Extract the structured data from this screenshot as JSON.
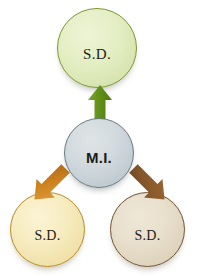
{
  "diagram": {
    "nodes": [
      {
        "id": "top",
        "label": "S.D.",
        "fill": "#e4eec4",
        "stroke": "#7e9430",
        "position": "top"
      },
      {
        "id": "center",
        "label": "M.I.",
        "fill": "#d2dade",
        "stroke": "#69797f",
        "position": "center"
      },
      {
        "id": "bottom-left",
        "label": "S.D.",
        "fill": "#f7ecc0",
        "stroke": "#b88a27",
        "position": "bottom-left"
      },
      {
        "id": "bottom-right",
        "label": "S.D.",
        "fill": "#e8dfcc",
        "stroke": "#6f5232",
        "position": "bottom-right"
      }
    ],
    "arrows": [
      {
        "id": "arrow-up",
        "from": "center",
        "to": "top",
        "direction": "up",
        "color": "#5f8c1e"
      },
      {
        "id": "arrow-down-left",
        "from": "center",
        "to": "bottom-left",
        "direction": "down-left",
        "color": "#cf8420"
      },
      {
        "id": "arrow-down-right",
        "from": "center",
        "to": "bottom-right",
        "direction": "down-right",
        "color": "#8b5a2b"
      }
    ],
    "background": "#ffffff"
  }
}
